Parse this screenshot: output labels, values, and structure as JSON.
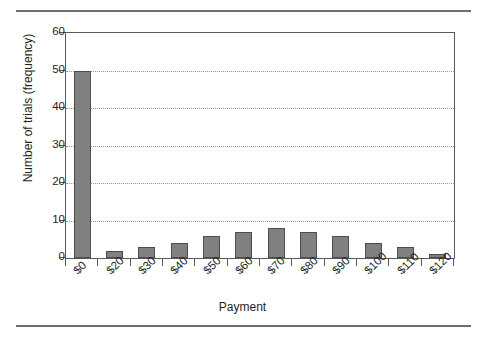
{
  "chart_data": {
    "type": "bar",
    "title": "",
    "xlabel": "Payment",
    "ylabel": "Number of trials (frequency)",
    "categories": [
      "$0",
      "$20",
      "$30",
      "$40",
      "$50",
      "$60",
      "$70",
      "$80",
      "$90",
      "$100",
      "$110",
      "$120"
    ],
    "values": [
      50,
      2,
      3,
      4,
      6,
      7,
      8,
      7,
      6,
      4,
      3,
      1
    ],
    "ylim": [
      0,
      60
    ],
    "yticks": [
      0,
      10,
      20,
      30,
      40,
      50,
      60
    ],
    "ytick_labels": [
      "0",
      "10",
      "20",
      "30",
      "40",
      "50",
      "60"
    ],
    "grid": "horizontal-dotted",
    "legend": "none",
    "bar_color": "#808080",
    "bar_border_color": "#4d4d4f",
    "axis_color": "#58595b",
    "gridline_color": "#9a9a9a",
    "rule_color": "#6d6e71",
    "background": "#ffffff"
  }
}
